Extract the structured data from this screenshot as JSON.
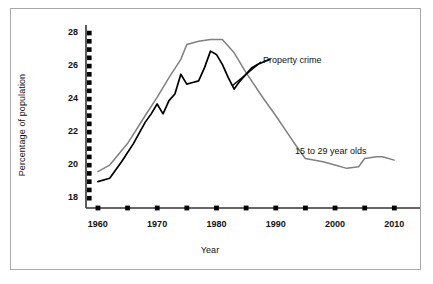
{
  "chart_data": {
    "type": "line",
    "title": "",
    "xlabel": "Year",
    "ylabel": "Percentage of population",
    "xlim": [
      1958,
      2013
    ],
    "ylim": [
      17.4,
      28.3
    ],
    "grid": false,
    "legend_position": "inline-annotations",
    "y_ticks_major": [
      18,
      20,
      22,
      24,
      26,
      28
    ],
    "y_ticks_minor": [
      18.5,
      19,
      19.5,
      20.5,
      21,
      21.5,
      22.5,
      23,
      23.5,
      24.5,
      25,
      25.5,
      26.5,
      27,
      27.5
    ],
    "y_tick_labels": [
      "18",
      "20",
      "22",
      "24",
      "26",
      "28"
    ],
    "x_ticks": [
      1960,
      1965,
      1970,
      1975,
      1980,
      1985,
      1990,
      1995,
      2000,
      2005,
      2010
    ],
    "x_tick_labels": [
      "1960",
      "",
      "1970",
      "",
      "1980",
      "",
      "1990",
      "",
      "2000",
      "",
      "2010"
    ],
    "x_labeled_ticks": [
      1960,
      1970,
      1980,
      1990,
      2000,
      2010
    ],
    "series": [
      {
        "name": "15 to 29 year olds",
        "color": "#808080",
        "x": [
          1960,
          1962,
          1965,
          1968,
          1970,
          1972,
          1974,
          1975,
          1977,
          1979,
          1981,
          1983,
          1985,
          1988,
          1990,
          1993,
          1995,
          1998,
          2000,
          2002,
          2004,
          2005,
          2007,
          2008,
          2010
        ],
        "values": [
          19.6,
          20.0,
          21.3,
          23.0,
          24.1,
          25.3,
          26.4,
          27.3,
          27.5,
          27.6,
          27.6,
          26.8,
          25.6,
          24.0,
          23.0,
          21.4,
          20.4,
          20.2,
          20.0,
          19.8,
          19.9,
          20.4,
          20.5,
          20.5,
          20.3
        ]
      },
      {
        "name": "Property crime",
        "color": "#000000",
        "x": [
          1960,
          1962,
          1964,
          1966,
          1968,
          1969,
          1970,
          1971,
          1972,
          1973,
          1974,
          1975,
          1976,
          1977,
          1978,
          1979,
          1980,
          1981,
          1982,
          1983,
          1984,
          1986,
          1987,
          1989
        ],
        "values": [
          19.0,
          19.2,
          20.2,
          21.3,
          22.6,
          23.1,
          23.7,
          23.1,
          23.9,
          24.3,
          25.5,
          24.9,
          25.0,
          25.1,
          25.9,
          26.9,
          26.7,
          26.1,
          25.3,
          24.6,
          25.1,
          25.9,
          26.1,
          26.4
        ]
      }
    ],
    "annotations": [
      {
        "text": "Property crime",
        "x": 263,
        "y": 55,
        "leader": {
          "from_x": 261,
          "from_y": 62,
          "to_x": 232,
          "to_y": 86
        }
      },
      {
        "text": "15 to 29 year olds",
        "x": 295,
        "y": 146,
        "leader": null
      }
    ]
  }
}
